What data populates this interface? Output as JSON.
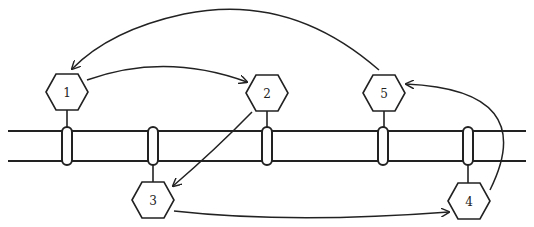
{
  "diagram": {
    "membrane": {
      "top_y": 131,
      "bottom_y": 161,
      "x_start": 8,
      "x_end": 526
    },
    "nodes": [
      {
        "id": "1",
        "label": "1",
        "cx": 67,
        "cy": 92,
        "side": "top"
      },
      {
        "id": "2",
        "label": "2",
        "cx": 267,
        "cy": 93,
        "side": "top"
      },
      {
        "id": "3",
        "label": "3",
        "cx": 153,
        "cy": 200,
        "side": "bottom"
      },
      {
        "id": "4",
        "label": "4",
        "cx": 469,
        "cy": 201,
        "side": "bottom"
      },
      {
        "id": "5",
        "label": "5",
        "cx": 384,
        "cy": 93,
        "side": "top"
      }
    ],
    "pores_x": [
      67,
      153,
      267,
      383,
      468
    ],
    "edges": [
      {
        "from": "1",
        "to": "2"
      },
      {
        "from": "2",
        "to": "3"
      },
      {
        "from": "3",
        "to": "4"
      },
      {
        "from": "4",
        "to": "5"
      },
      {
        "from": "5",
        "to": "1"
      }
    ],
    "colors": {
      "stroke": "#222222",
      "background": "#ffffff"
    }
  }
}
